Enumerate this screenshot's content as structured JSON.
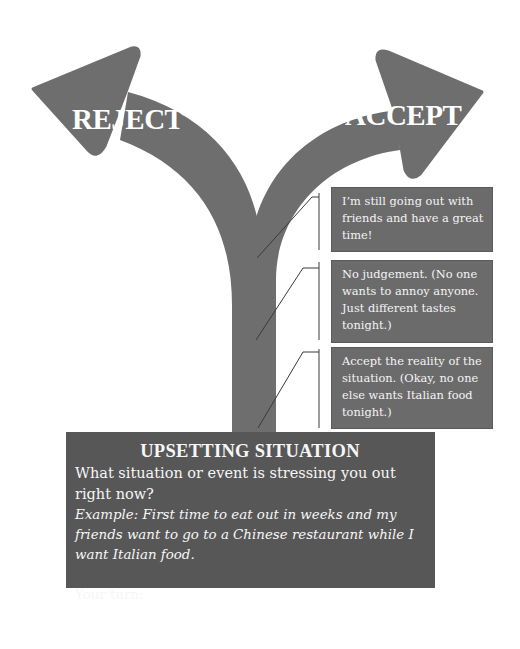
{
  "colors": {
    "arrow": "#6e6e6e",
    "step_box": "#6b6b6b",
    "situation_box": "#575757",
    "connector": "#3a3a3a",
    "text": "#ffffff"
  },
  "arrows": {
    "left_label": "REJECT",
    "right_label": "ACCEPT"
  },
  "steps": [
    {
      "text": "I’m still going out with friends and have a great time!"
    },
    {
      "text": "No judgement. (No one wants to annoy anyone. Just different tastes tonight.)"
    },
    {
      "text": "Accept the reality of the situation. (Okay, no one else wants Italian food tonight.)"
    }
  ],
  "situation": {
    "title": "UPSETTING SITUATION",
    "question": "What situation or event is stressing you out right now?",
    "example": "Example: First time to eat out in weeks and my friends want to go to a Chinese restaurant while I want Italian food.",
    "prompt": "Your turn:"
  }
}
